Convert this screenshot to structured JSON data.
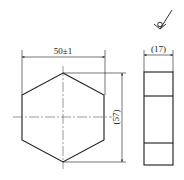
{
  "drawing": {
    "type": "engineering-drawing",
    "subject": "hexagonal prism part",
    "views": [
      "front-view",
      "side-view"
    ],
    "colors": {
      "line": "#1a1a1a",
      "center_line": "#555555",
      "background": "#ffffff"
    }
  },
  "surface_finish": {
    "symbol": "surface-roughness-machining-prohibited-icon"
  },
  "dimensions": {
    "width": "50±1",
    "height": "(57)",
    "thickness": "(17)"
  }
}
